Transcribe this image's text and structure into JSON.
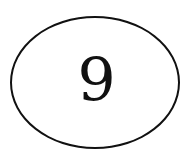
{
  "figure": {
    "shape": "ellipse",
    "label": "9",
    "stroke_color": "#111111",
    "text_color": "#111111",
    "background_color": "#ffffff"
  }
}
